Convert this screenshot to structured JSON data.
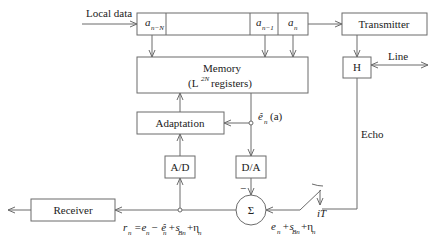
{
  "diagram": {
    "inputs": {
      "local_data": "Local data"
    },
    "shift_register": {
      "cells": [
        {
          "base": "a",
          "sub": "n−N"
        },
        {
          "base": "a",
          "sub": "n−1"
        },
        {
          "base": "a",
          "sub": "n"
        }
      ]
    },
    "blocks": {
      "memory_line1": "Memory",
      "memory_line2_pre": "(L",
      "memory_line2_sup": "2N",
      "memory_line2_post": " registers)",
      "adaptation": "Adaptation",
      "ad": "A/D",
      "da": "D/A",
      "sum": "Σ",
      "receiver": "Receiver",
      "transmitter": "Transmitter",
      "hybrid": "H"
    },
    "labels": {
      "line": "Line",
      "echo": "Echo",
      "sampler": "iT",
      "minus": "−",
      "echo_estimate": {
        "hat": "ê",
        "sub": "n",
        "arg": "(a)"
      },
      "received_signal": {
        "lhs": "r",
        "lhs_sub": "n",
        "rhs": "=e",
        "t1_sub": "n",
        "t2": "− ê",
        "t2_sub": "n",
        "t3": "+s",
        "t3_sub": "Bn",
        "t4": "+η",
        "t4_sub": "n"
      },
      "line_signal": {
        "t1": "e",
        "t1_sub": "n",
        "t2": "+s",
        "t2_sub": "Bn",
        "t3": "+η",
        "t3_sub": "n"
      }
    }
  }
}
